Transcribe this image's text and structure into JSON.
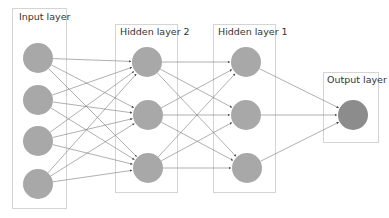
{
  "diagram": {
    "type": "neural-network",
    "colors": {
      "node": "#a8a8a8",
      "output_node": "#8c8c8c",
      "edge": "#7a7a7a",
      "box_border": "#d4d4d4",
      "label": "#333333"
    },
    "layers": [
      {
        "id": "input",
        "label": "Input layer",
        "nodes": 4
      },
      {
        "id": "hidden2",
        "label": "Hidden layer 2",
        "nodes": 3
      },
      {
        "id": "hidden1",
        "label": "Hidden layer 1",
        "nodes": 3
      },
      {
        "id": "output",
        "label": "Output layer",
        "nodes": 1
      }
    ],
    "connectivity": "fully-connected, left to right, arrowheads on targets"
  }
}
